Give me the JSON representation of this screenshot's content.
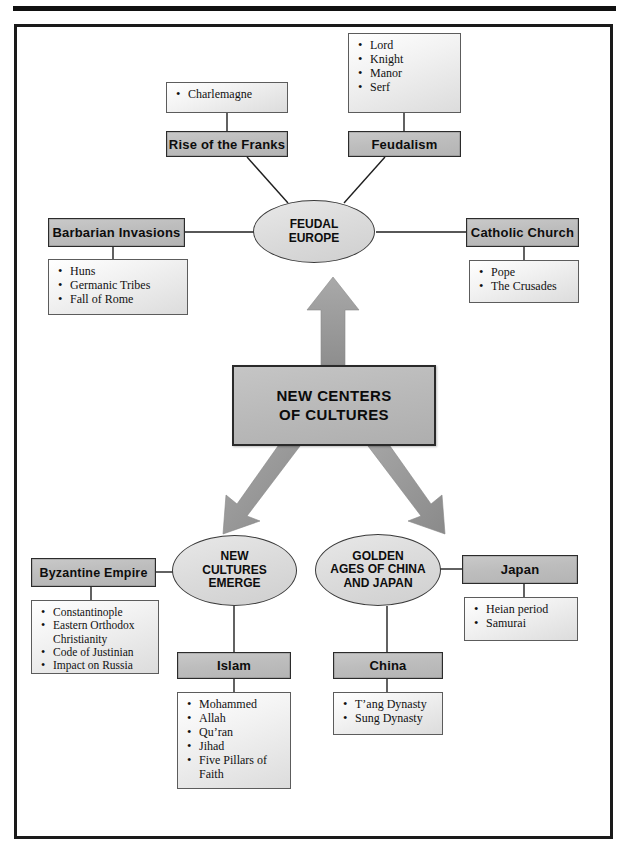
{
  "center": {
    "label": "NEW CENTERS\nOF CULTURES"
  },
  "hubs": {
    "feudal_europe": "FEUDAL\nEUROPE",
    "new_cultures": "NEW\nCULTURES\nEMERGE",
    "golden_ages": "GOLDEN\nAGES OF CHINA\nAND JAPAN"
  },
  "branches": [
    {
      "id": "rise-of-the-franks",
      "title": "Rise of the Franks",
      "items": [
        "Charlemagne"
      ]
    },
    {
      "id": "feudalism",
      "title": "Feudalism",
      "items": [
        "Lord",
        "Knight",
        "Manor",
        "Serf"
      ]
    },
    {
      "id": "barbarian-invasions",
      "title": "Barbarian Invasions",
      "items": [
        "Huns",
        "Germanic Tribes",
        "Fall of Rome"
      ]
    },
    {
      "id": "catholic-church",
      "title": "Catholic Church",
      "items": [
        "Pope",
        "The Crusades"
      ]
    },
    {
      "id": "byzantine-empire",
      "title": "Byzantine Empire",
      "items": [
        "Constantinople",
        "Eastern Orthodox\nChristianity",
        "Code of Justinian",
        "Impact on Russia"
      ]
    },
    {
      "id": "islam",
      "title": "Islam",
      "items": [
        "Mohammed",
        "Allah",
        "Qu’ran",
        "Jihad",
        "Five Pillars of\nFaith"
      ]
    },
    {
      "id": "china",
      "title": "China",
      "items": [
        "T’ang Dynasty",
        "Sung Dynasty"
      ]
    },
    {
      "id": "japan",
      "title": "Japan",
      "items": [
        "Heian period",
        "Samurai"
      ]
    }
  ],
  "colors": {
    "title_box_fill": "#bdbdbd",
    "list_box_fill": "#ececec",
    "ellipse_fill": "#dcdcdc",
    "center_fill": "#b9b9b9",
    "arrow_fill": "#9a9a9a",
    "outline": "#2b2b2b",
    "rule": "#111111"
  },
  "arrows": [
    {
      "name": "arrow-up-to-feudal-europe",
      "direction": "up"
    },
    {
      "name": "arrow-down-left-to-new-cultures",
      "direction": "down-left"
    },
    {
      "name": "arrow-down-right-to-golden-ages",
      "direction": "down-right"
    }
  ]
}
